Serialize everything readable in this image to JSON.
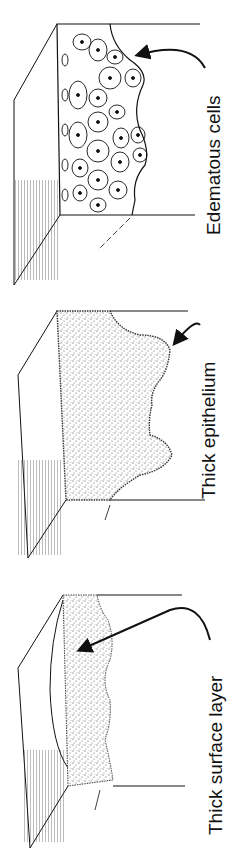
{
  "figure": {
    "panels": [
      {
        "id": "edematous",
        "label": "Edematous cells",
        "fill": "cells"
      },
      {
        "id": "thick-epithelium",
        "label": "Thick epithelium",
        "fill": "stipple"
      },
      {
        "id": "thick-surface",
        "label": "Thick surface layer",
        "fill": "stipple"
      }
    ],
    "colors": {
      "ink": "#111111",
      "paper": "#ffffff",
      "stipple": "#555555"
    }
  }
}
